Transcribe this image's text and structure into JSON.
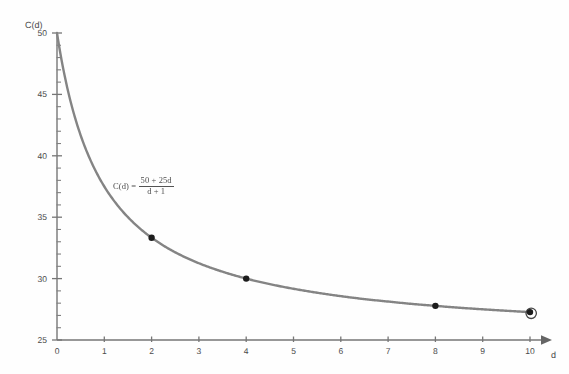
{
  "chart_data": {
    "type": "line",
    "title": "",
    "subtitle": "",
    "xlabel": "d",
    "ylabel": "C(d)",
    "function_label": "C(d) =",
    "function_numerator": "50 + 25d",
    "function_denominator": "d + 1",
    "function_expression": "C(d) = (50 + 25d) / (d + 1)",
    "grid": false,
    "legend": null,
    "xlim": [
      0,
      10
    ],
    "ylim": [
      25,
      50
    ],
    "xticks": [
      0,
      1,
      2,
      3,
      4,
      5,
      6,
      7,
      8,
      9,
      10
    ],
    "xtick_labels": [
      "0",
      "1",
      "2",
      "3",
      "4",
      "5",
      "6",
      "7",
      "8",
      "9",
      "10"
    ],
    "yticks": [
      25,
      30,
      35,
      40,
      45,
      50
    ],
    "ytick_labels": [
      "25",
      "30",
      "35",
      "40",
      "45",
      "50"
    ],
    "y_minor_tick_step": 1,
    "x_axis_arrow": true,
    "y_axis_arrow": false,
    "curve_color": "#7e7e7e",
    "marker_color": "#101010",
    "axis_color": "#6f6f6f",
    "x": [
      0,
      0.25,
      0.5,
      0.75,
      1,
      1.5,
      2,
      2.5,
      3,
      3.5,
      4,
      4.5,
      5,
      5.5,
      6,
      6.5,
      7,
      7.5,
      8,
      8.5,
      9,
      9.5,
      10
    ],
    "y": [
      50,
      45,
      41.67,
      39.29,
      37.5,
      35,
      33.33,
      32.14,
      31.25,
      30.56,
      30,
      29.55,
      29.17,
      28.85,
      28.57,
      28.33,
      28.13,
      27.94,
      27.78,
      27.63,
      27.5,
      27.38,
      27.27
    ],
    "markers": [
      {
        "x": 2,
        "y": 33.33,
        "label": "",
        "halo": false
      },
      {
        "x": 4,
        "y": 30,
        "label": "",
        "halo": false
      },
      {
        "x": 8,
        "y": 27.78,
        "label": "",
        "halo": false
      },
      {
        "x": 10,
        "y": 27.27,
        "label": "",
        "halo": true
      }
    ],
    "annotations": [
      {
        "text": "C(d) = (50 + 25d)/(d + 1)",
        "x": 1.7,
        "y": 36.2
      }
    ]
  }
}
